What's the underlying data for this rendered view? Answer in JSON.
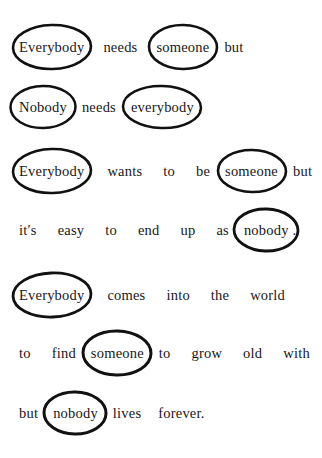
{
  "page": {
    "background_color": "#ffffff",
    "ink_color": "#111111",
    "circle_shape": "hand-drawn ellipse"
  },
  "lines": [
    {
      "id": "line-1",
      "top": 40,
      "tokens": [
        {
          "text": "Everybody",
          "circled": true,
          "gap": "l",
          "w": 78,
          "h": 44,
          "rot": -1.5,
          "sw": 2.6
        },
        {
          "text": "needs",
          "circled": false,
          "gap": "l"
        },
        {
          "text": "someone",
          "circled": true,
          "gap": "m",
          "w": 68,
          "h": 44,
          "rot": 1.0,
          "sw": 2.6
        },
        {
          "text": "but",
          "circled": false,
          "gap": "s"
        }
      ]
    },
    {
      "id": "line-2",
      "top": 100,
      "tokens": [
        {
          "text": "Nobody",
          "circled": true,
          "gap": "m",
          "w": 65,
          "h": 42,
          "rot": -1.0,
          "sw": 2.5
        },
        {
          "text": "needs",
          "circled": false,
          "gap": "m"
        },
        {
          "text": "everybody",
          "circled": true,
          "gap": "s",
          "w": 78,
          "h": 42,
          "rot": 1.5,
          "sw": 2.5,
          "after": "."
        }
      ]
    },
    {
      "id": "line-3",
      "top": 164,
      "tokens": [
        {
          "text": "Everybody",
          "circled": true,
          "gap": "xl",
          "w": 78,
          "h": 44,
          "rot": -1.5,
          "sw": 2.6
        },
        {
          "text": "wants",
          "circled": false,
          "gap": "xl"
        },
        {
          "text": "to",
          "circled": false,
          "gap": "xl"
        },
        {
          "text": "be",
          "circled": false,
          "gap": "m"
        },
        {
          "text": "someone",
          "circled": true,
          "gap": "m",
          "w": 68,
          "h": 42,
          "rot": 1.0,
          "sw": 2.6
        },
        {
          "text": "but",
          "circled": false,
          "gap": "s"
        }
      ]
    },
    {
      "id": "line-4",
      "top": 223,
      "tokens": [
        {
          "text": "it′s",
          "circled": false,
          "gap": "xl"
        },
        {
          "text": "easy",
          "circled": false,
          "gap": "xl"
        },
        {
          "text": "to",
          "circled": false,
          "gap": "xl"
        },
        {
          "text": "end",
          "circled": false,
          "gap": "xl"
        },
        {
          "text": "up",
          "circled": false,
          "gap": "xl"
        },
        {
          "text": "as",
          "circled": false,
          "gap": "m"
        },
        {
          "text": "nobody",
          "circled": true,
          "gap": "s",
          "w": 64,
          "h": 42,
          "rot": 1.5,
          "sw": 2.8,
          "after": "."
        }
      ]
    },
    {
      "id": "line-5",
      "top": 288,
      "tokens": [
        {
          "text": "Everybody",
          "circled": true,
          "gap": "xl",
          "w": 78,
          "h": 44,
          "rot": -2.0,
          "sw": 2.8
        },
        {
          "text": "comes",
          "circled": false,
          "gap": "xl"
        },
        {
          "text": "into",
          "circled": false,
          "gap": "xl"
        },
        {
          "text": "the",
          "circled": false,
          "gap": "xl"
        },
        {
          "text": "world",
          "circled": false,
          "gap": "s"
        }
      ]
    },
    {
      "id": "line-6",
      "top": 346,
      "tokens": [
        {
          "text": "to",
          "circled": false,
          "gap": "xl"
        },
        {
          "text": "find",
          "circled": false,
          "gap": "m"
        },
        {
          "text": "someone",
          "circled": true,
          "gap": "m",
          "w": 68,
          "h": 44,
          "rot": 1.0,
          "sw": 3.0
        },
        {
          "text": "to",
          "circled": false,
          "gap": "xl"
        },
        {
          "text": "grow",
          "circled": false,
          "gap": "xl"
        },
        {
          "text": "old",
          "circled": false,
          "gap": "xl"
        },
        {
          "text": "with",
          "circled": false,
          "gap": "s"
        }
      ]
    },
    {
      "id": "line-7",
      "top": 406,
      "tokens": [
        {
          "text": "but",
          "circled": false,
          "gap": "m"
        },
        {
          "text": "nobody",
          "circled": true,
          "gap": "m",
          "w": 62,
          "h": 42,
          "rot": 1.0,
          "sw": 3.0
        },
        {
          "text": "lives",
          "circled": false,
          "gap": "l"
        },
        {
          "text": "forever.",
          "circled": false,
          "gap": "s"
        }
      ]
    }
  ],
  "line_indents": [
    16,
    16,
    16,
    18,
    16,
    18,
    18
  ],
  "poem_text": "Everybody needs someone but Nobody needs everybody. Everybody wants to be someone but it′s easy to end up as nobody. Everybody comes into the world to find someone to grow old with but nobody lives forever."
}
